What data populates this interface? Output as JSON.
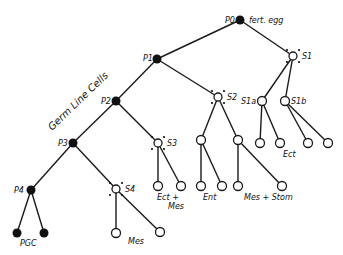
{
  "diagram": {
    "title_label": "Germ Line Cells",
    "nodes": {
      "P0": {
        "label": "P0",
        "annotation": "fert. egg"
      },
      "P1": {
        "label": "P1"
      },
      "P2": {
        "label": "P2"
      },
      "P3": {
        "label": "P3"
      },
      "P4": {
        "label": "P4"
      },
      "S1": {
        "label": "S1"
      },
      "S1a": {
        "label": "S1a"
      },
      "S1b": {
        "label": "S1b"
      },
      "S2": {
        "label": "S2"
      },
      "S3": {
        "label": "S3"
      },
      "S4": {
        "label": "S4"
      }
    },
    "fate_labels": {
      "pgc": "PGC",
      "s4_mes": "Mes",
      "s3_ect": "Ect +",
      "s3_mes": "Mes",
      "s2_ent": "Ent",
      "s2_messtom": "Mes + Stom",
      "s1_ect": "Ect"
    },
    "colors": {
      "line": "#1a1a1a",
      "fill": "#111111",
      "background": "#ffffff"
    }
  }
}
